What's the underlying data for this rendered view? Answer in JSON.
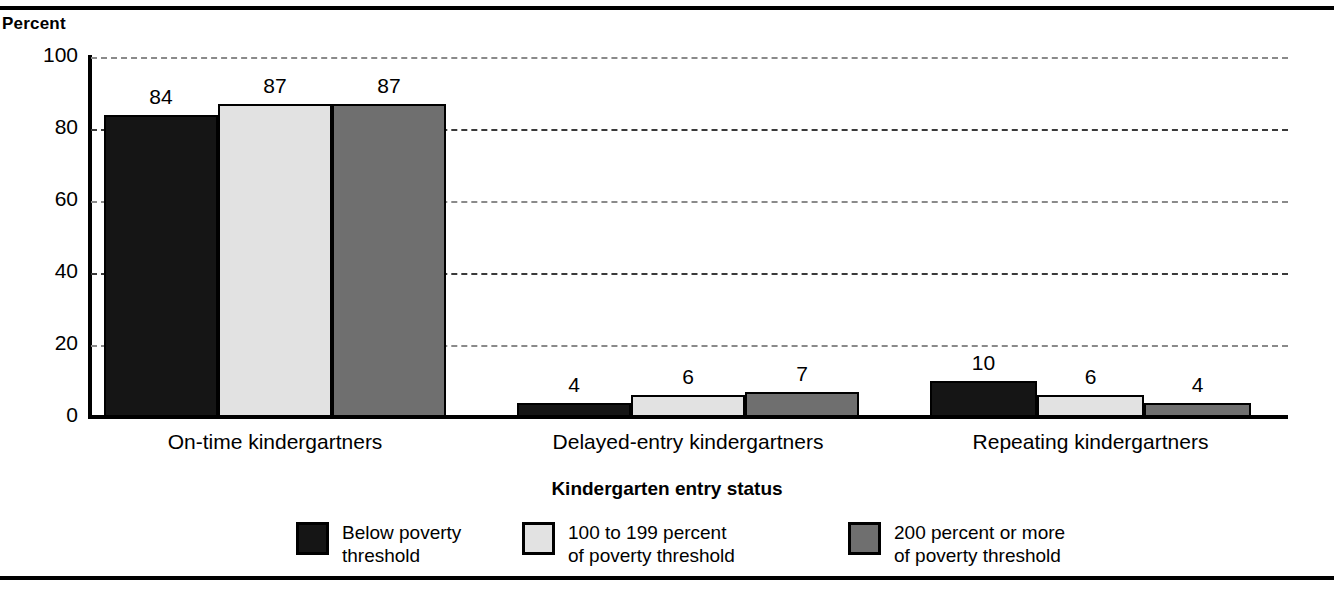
{
  "rules": {
    "top": "rule-top",
    "bottom": "rule-bottom"
  },
  "chart_data": {
    "type": "bar",
    "title": "",
    "xlabel": "Kindergarten entry status",
    "ylabel": "Percent",
    "ylim": [
      0,
      100
    ],
    "yticks": [
      0,
      20,
      40,
      60,
      80,
      100
    ],
    "ytick_labels": [
      "0",
      "20",
      "40",
      "60",
      "80",
      "100"
    ],
    "grid": "horizontal-dashed",
    "legend_position": "bottom",
    "categories": [
      "On-time kindergartners",
      "Delayed-entry kindergartners",
      "Repeating kindergartners"
    ],
    "series": [
      {
        "name": "Below poverty\nthreshold",
        "color": "#151515",
        "values": [
          84,
          4,
          10
        ],
        "value_labels": [
          "84",
          "4",
          "10"
        ]
      },
      {
        "name": "100 to 199 percent\nof poverty threshold",
        "color": "#e2e2e2",
        "values": [
          87,
          6,
          6
        ],
        "value_labels": [
          "87",
          "6",
          "6"
        ]
      },
      {
        "name": "200 percent or more\nof poverty threshold",
        "color": "#6f6f6f",
        "values": [
          87,
          7,
          4
        ],
        "value_labels": [
          "87",
          "7",
          "4"
        ]
      }
    ]
  }
}
